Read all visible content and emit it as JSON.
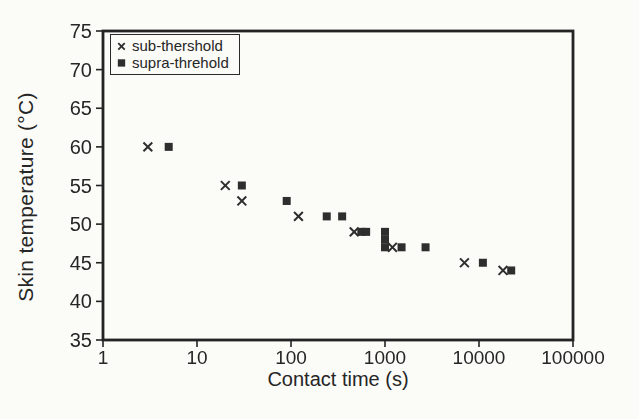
{
  "figure": {
    "background": "#fbfbf8",
    "ink": "#262626"
  },
  "chart_data": {
    "type": "scatter",
    "title": "",
    "xlabel": "Contact time (s)",
    "ylabel": "Skin temperature (°C)",
    "x_scale": "log",
    "y_scale": "linear",
    "xlim": [
      1,
      100000
    ],
    "ylim": [
      35,
      75
    ],
    "x_ticks": [
      1,
      10,
      100,
      1000,
      10000,
      100000
    ],
    "y_ticks": [
      35,
      40,
      45,
      50,
      55,
      60,
      65,
      70,
      75
    ],
    "grid": false,
    "legend_position": "top-left",
    "series": [
      {
        "name": "sub-thershold",
        "marker": "x",
        "color": "#2e2e2e",
        "points": [
          [
            3,
            60
          ],
          [
            20,
            55
          ],
          [
            30,
            53
          ],
          [
            120,
            51
          ],
          [
            470,
            49
          ],
          [
            1200,
            47
          ],
          [
            7000,
            45
          ],
          [
            18000,
            44
          ]
        ]
      },
      {
        "name": "supra-threhold",
        "marker": "square",
        "color": "#2e2e2e",
        "points": [
          [
            5,
            60
          ],
          [
            30,
            55
          ],
          [
            90,
            53
          ],
          [
            240,
            51
          ],
          [
            350,
            51
          ],
          [
            560,
            49
          ],
          [
            630,
            49
          ],
          [
            1000,
            49
          ],
          [
            1000,
            48
          ],
          [
            1000,
            47
          ],
          [
            1500,
            47
          ],
          [
            2700,
            47
          ],
          [
            11000,
            45
          ],
          [
            22000,
            44
          ]
        ]
      }
    ]
  }
}
